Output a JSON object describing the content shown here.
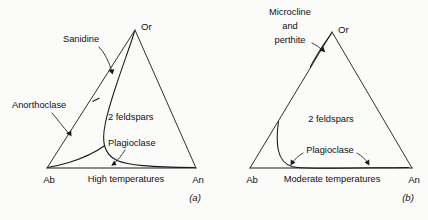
{
  "figure": {
    "background_color": "#fbfbfa",
    "line_color": "#1a1a1a"
  },
  "panels": [
    {
      "id": "a",
      "panel_label": "(a)",
      "caption": "High temperatures",
      "vertices": {
        "left": "Ab",
        "apex": "Or",
        "right": "An"
      },
      "field_label": "2 feldspars",
      "annotations": [
        {
          "text": "Sanidine"
        },
        {
          "text": "Anorthoclase"
        },
        {
          "text": "Plagioclase"
        }
      ]
    },
    {
      "id": "b",
      "panel_label": "(b)",
      "caption": "Moderate temperatures",
      "vertices": {
        "left": "Ab",
        "apex": "Or",
        "right": "An"
      },
      "field_label": "2 feldspars",
      "annotations": [
        {
          "text": "Microcline",
          "line": 1
        },
        {
          "text": "and",
          "line": 2
        },
        {
          "text": "perthite",
          "line": 3
        },
        {
          "text": "Plagioclase"
        }
      ]
    }
  ]
}
